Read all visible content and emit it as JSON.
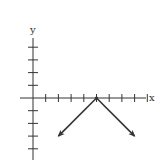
{
  "chart_data": {
    "type": "line",
    "title": "",
    "xlabel": "x",
    "ylabel": "y",
    "grid": false,
    "axis_ticks": {
      "x_ticks_positive": 9,
      "y_ticks_positive": 4,
      "y_ticks_negative": 4
    },
    "xlim": [
      -1,
      9
    ],
    "ylim": [
      -5,
      5
    ],
    "series": [
      {
        "name": "absolute value graph",
        "equation": "y = -|x - 5|",
        "vertex": [
          5,
          0
        ],
        "x": [
          2,
          5,
          8
        ],
        "y": [
          -3,
          0,
          -3
        ],
        "arrows_at_ends": true,
        "color": "#333333"
      }
    ]
  },
  "labels": {
    "x_axis": "x",
    "y_axis": "y"
  },
  "colors": {
    "axis": "#333333",
    "background": "#ffffff"
  }
}
